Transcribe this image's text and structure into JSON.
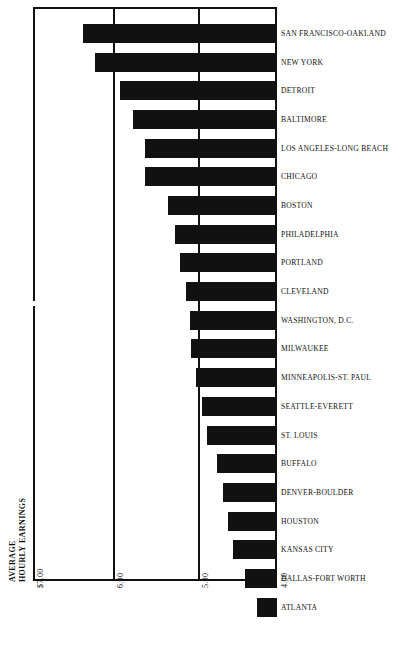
{
  "chart_data": {
    "type": "bar",
    "orientation": "horizontal",
    "title": "",
    "subtitle": "",
    "xlabel": "AVERAGE HOURLY EARNINGS",
    "ylabel": "",
    "axis_title_lines": [
      "AVERAGE",
      "HOURLY EARNINGS"
    ],
    "xlim": [
      7.0,
      4.0
    ],
    "axis_reversed": true,
    "axis_break": true,
    "grid": true,
    "gridlines_at": [
      6.0,
      5.0
    ],
    "legend": null,
    "bar_color": "#111111",
    "background_color": "#ffffff",
    "tick_labels": [
      "$7.00",
      "6.00",
      "5.00",
      "4.00"
    ],
    "tick_values": [
      7.0,
      6.0,
      5.0,
      4.0
    ],
    "categories": [
      "SAN FRANCISCO-OAKLAND",
      "NEW YORK",
      "DETROIT",
      "BALTIMORE",
      "LOS ANGELES-LONG BEACH",
      "CHICAGO",
      "BOSTON",
      "PHILADELPHIA",
      "PORTLAND",
      "CLEVELAND",
      "WASHINGTON, D.C.",
      "MILWAUKEE",
      "MINNEAPOLIS-ST. PAUL",
      "SEATTLE-EVERETT",
      "ST. LOUIS",
      "BUFFALO",
      "DENVER-BOULDER",
      "HOUSTON",
      "KANSAS CITY",
      "DALLAS-FORT WORTH",
      "ATLANTA"
    ],
    "values": [
      6.38,
      6.24,
      5.93,
      5.78,
      5.63,
      5.63,
      5.36,
      5.28,
      5.22,
      5.15,
      5.1,
      5.09,
      5.03,
      4.96,
      4.9,
      4.78,
      4.71,
      4.65,
      4.59,
      4.45,
      4.31
    ],
    "value_unit": "dollars per hour",
    "bars_px": [
      {
        "left": 83,
        "width": 194
      },
      {
        "left": 95,
        "width": 182
      },
      {
        "left": 120,
        "width": 157
      },
      {
        "left": 133,
        "width": 144
      },
      {
        "left": 145,
        "width": 132
      },
      {
        "left": 145,
        "width": 132
      },
      {
        "left": 168,
        "width": 109
      },
      {
        "left": 175,
        "width": 102
      },
      {
        "left": 180,
        "width": 97
      },
      {
        "left": 186,
        "width": 91
      },
      {
        "left": 190,
        "width": 87
      },
      {
        "left": 191,
        "width": 86
      },
      {
        "left": 196,
        "width": 81
      },
      {
        "left": 202,
        "width": 75
      },
      {
        "left": 207,
        "width": 70
      },
      {
        "left": 217,
        "width": 60
      },
      {
        "left": 223,
        "width": 54
      },
      {
        "left": 228,
        "width": 49
      },
      {
        "left": 233,
        "width": 44
      },
      {
        "left": 245,
        "width": 32
      },
      {
        "left": 257,
        "width": 20
      }
    ]
  }
}
